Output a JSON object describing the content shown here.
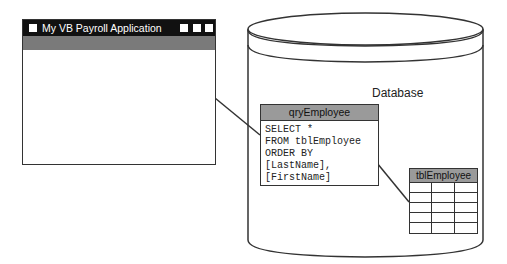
{
  "window": {
    "title": "My VB Payroll Application",
    "controls": [
      "minimize",
      "maximize",
      "close"
    ]
  },
  "database": {
    "label": "Database"
  },
  "query": {
    "name": "qryEmployee",
    "sql": "SELECT *\nFROM tblEmployee\nORDER BY\n[LastName],\n[FirstName]"
  },
  "table": {
    "name": "tblEmployee",
    "rows": 5,
    "columns": 3
  },
  "colors": {
    "titlebar": "#111111",
    "band": "#7a7a7a",
    "header": "#9a9a9a",
    "stroke": "#333333"
  }
}
